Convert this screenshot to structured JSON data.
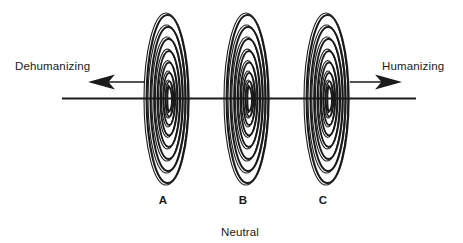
{
  "figure": {
    "type": "conceptual-continuum-diagram",
    "background_color": "#ffffff",
    "ink_color": "#1a1a1a",
    "axis": {
      "orientation": "horizontal",
      "left_label": "Dehumanizing",
      "right_label": "Humanizing",
      "center_label": "Neutral",
      "left_arrow_icon": "arrow-left",
      "right_arrow_icon": "arrow-right"
    },
    "spirals": [
      {
        "label": "A",
        "icon": "concentric-spiral-vortex"
      },
      {
        "label": "B",
        "icon": "concentric-spiral-vortex"
      },
      {
        "label": "C",
        "icon": "concentric-spiral-vortex"
      }
    ]
  }
}
